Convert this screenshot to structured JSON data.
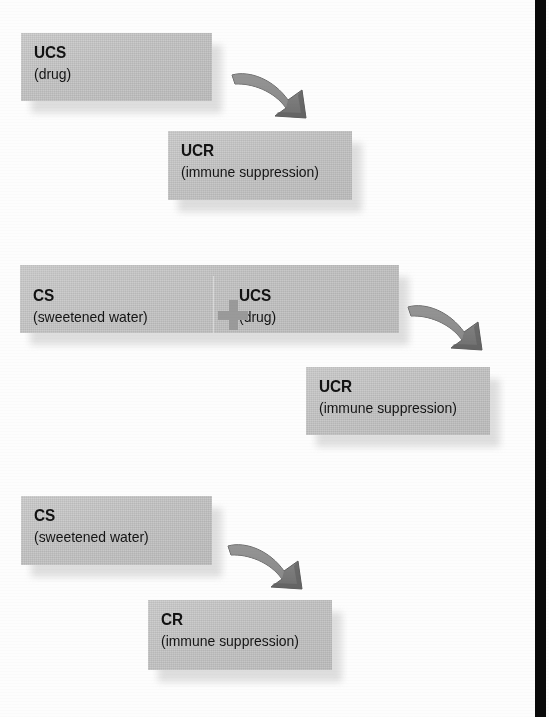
{
  "figure": {
    "background_color": "#fdfdfd",
    "box_fill_color": "#c6c6c6",
    "arrow_color": "#808080",
    "plus_color": "#9a9a9a",
    "gutter_color": "#0a0a0a",
    "text_color": "#121212"
  },
  "panels": [
    {
      "id": "panel-before-conditioning",
      "boxes": [
        {
          "id": "ucs-box",
          "acronym": "UCS",
          "detail": "(drug)"
        },
        {
          "id": "ucr-box",
          "acronym": "UCR",
          "detail": "(immune suppression)"
        }
      ],
      "arrows": [
        {
          "id": "arrow-ucs-to-ucr",
          "direction": "down-right"
        }
      ]
    },
    {
      "id": "panel-during-conditioning",
      "boxes": [
        {
          "id": "cs-box-paired",
          "acronym": "CS",
          "detail": "(sweetened water)"
        },
        {
          "id": "ucs-box-paired",
          "acronym": "UCS",
          "detail": "(drug)"
        },
        {
          "id": "ucr-box-paired",
          "acronym": "UCR",
          "detail": "(immune suppression)"
        }
      ],
      "operators": [
        {
          "id": "plus-operator",
          "symbol": "+"
        }
      ],
      "arrows": [
        {
          "id": "arrow-pair-to-ucr",
          "direction": "down-right"
        }
      ]
    },
    {
      "id": "panel-after-conditioning",
      "boxes": [
        {
          "id": "cs-box-alone",
          "acronym": "CS",
          "detail": "(sweetened water)"
        },
        {
          "id": "cr-box",
          "acronym": "CR",
          "detail": "(immune suppression)"
        }
      ],
      "arrows": [
        {
          "id": "arrow-cs-to-cr",
          "direction": "down-right"
        }
      ]
    }
  ]
}
